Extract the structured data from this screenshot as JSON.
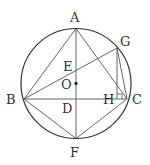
{
  "diagram": {
    "type": "geometry",
    "colors": {
      "stroke": "#555555",
      "circle": "#333333",
      "text": "#333333"
    },
    "circle": {
      "center": "O",
      "cx": 76,
      "cy": 83.5,
      "r": 55
    },
    "points": [
      {
        "id": "A",
        "x": 76,
        "y": 28.5,
        "label": "A",
        "lx": 70,
        "ly": 22
      },
      {
        "id": "B",
        "x": 24,
        "y": 99,
        "label": "B",
        "lx": 6,
        "ly": 104
      },
      {
        "id": "C",
        "x": 127,
        "y": 99,
        "label": "C",
        "lx": 132,
        "ly": 104
      },
      {
        "id": "F",
        "x": 76,
        "y": 138.5,
        "label": "F",
        "lx": 70,
        "ly": 157
      },
      {
        "id": "G",
        "x": 117,
        "y": 48,
        "label": "G",
        "lx": 120,
        "ly": 46
      },
      {
        "id": "E",
        "x": 76,
        "y": 72,
        "label": "E",
        "lx": 63,
        "ly": 71
      },
      {
        "id": "O",
        "x": 76,
        "y": 83.5,
        "label": "O",
        "lx": 61,
        "ly": 89
      },
      {
        "id": "D",
        "x": 76,
        "y": 99,
        "label": "D",
        "lx": 62,
        "ly": 113
      },
      {
        "id": "H",
        "x": 117,
        "y": 99,
        "label": "H",
        "lx": 103,
        "ly": 104
      }
    ],
    "segments": [
      [
        "A",
        "B"
      ],
      [
        "A",
        "C"
      ],
      [
        "A",
        "F"
      ],
      [
        "B",
        "C"
      ],
      [
        "B",
        "F"
      ],
      [
        "C",
        "F"
      ],
      [
        "B",
        "G"
      ],
      [
        "G",
        "C"
      ],
      [
        "G",
        "H"
      ]
    ],
    "right_angle": {
      "at": "H",
      "size": 5
    }
  }
}
